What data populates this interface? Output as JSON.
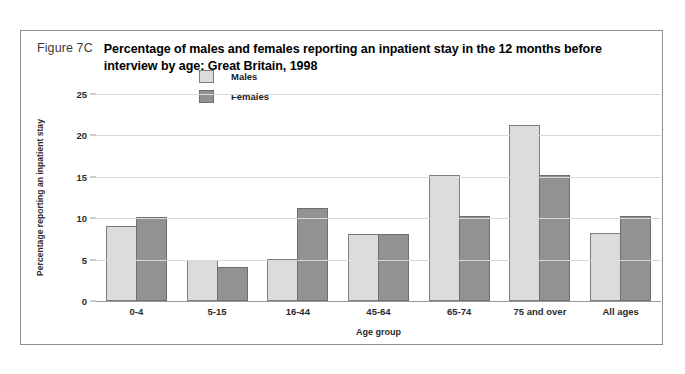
{
  "figure": {
    "number": "Figure 7C",
    "title": "Percentage of males and females reporting an inpatient stay in the 12 months before interview by age:  Great Britain, 1998"
  },
  "chart_data": {
    "type": "bar",
    "title": "Percentage of males and females reporting an inpatient stay in the 12 months before interview by age:  Great Britain, 1998",
    "xlabel": "Age group",
    "ylabel": "Percentage reporting an inpatient stay",
    "categories": [
      "0-4",
      "5-15",
      "16-44",
      "45-64",
      "65-74",
      "75 and over",
      "All ages"
    ],
    "series": [
      {
        "name": "Males",
        "color": "#dcdcdc",
        "values": [
          9.1,
          5.0,
          5.1,
          8.1,
          15.2,
          21.2,
          8.2
        ]
      },
      {
        "name": "Females",
        "color": "#929292",
        "values": [
          10.1,
          4.1,
          11.2,
          8.1,
          10.3,
          15.2,
          10.3
        ]
      }
    ],
    "ylim": [
      0,
      25
    ],
    "yticks": [
      0,
      5,
      10,
      15,
      20,
      25
    ],
    "grid": true,
    "legend_position": "top-center"
  }
}
